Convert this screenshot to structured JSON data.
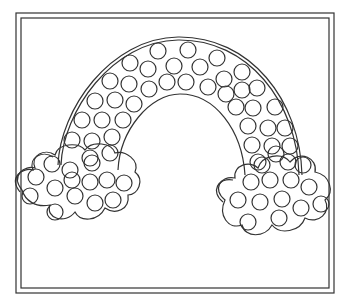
{
  "illustration": {
    "subject": "rainbow-dot-marker-coloring-page",
    "line_color": "#333333",
    "background": "#ffffff",
    "frame": {
      "outer": {
        "x": 16,
        "y": 13,
        "w": 318,
        "h": 280
      },
      "inner": {
        "x": 21,
        "y": 18,
        "w": 308,
        "h": 270
      }
    },
    "rainbow": {
      "dot_count": 50
    },
    "left_cloud": {
      "dot_count": 14
    },
    "right_cloud": {
      "dot_count": 13
    }
  }
}
